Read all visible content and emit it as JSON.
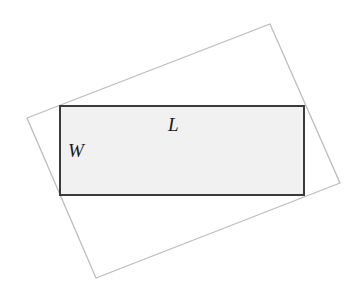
{
  "diagram": {
    "outer_rect": {
      "points": [
        [
          27,
          118
        ],
        [
          270,
          24
        ],
        [
          340,
          183
        ],
        [
          96,
          278
        ]
      ],
      "stroke": "#bdbdbd"
    },
    "inner_rect": {
      "x": 60,
      "y": 106,
      "width": 244,
      "height": 89,
      "fill": "#f1f1f1",
      "stroke": "#3a3a3a"
    },
    "labels": {
      "length": "L",
      "width": "W"
    }
  }
}
